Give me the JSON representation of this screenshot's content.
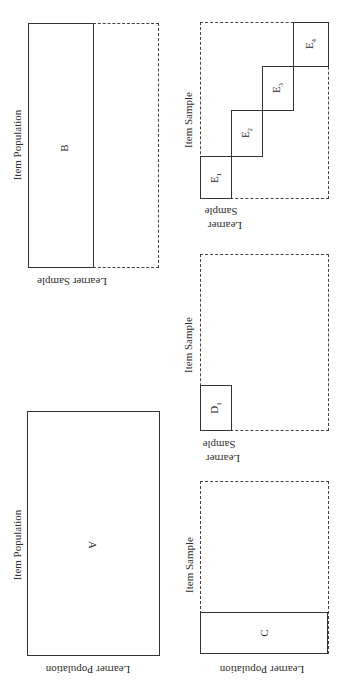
{
  "figure": {
    "orientation": "rotated 90 degrees (landscape figure printed sideways)",
    "panels": [
      {
        "id": "A",
        "letter": "A",
        "axis_item": "Item Population",
        "axis_learner": "Learner Population",
        "description": "Full solid box: entire item population by entire learner population"
      },
      {
        "id": "B",
        "letter": "B",
        "axis_item": "Item Population",
        "axis_learner": "Learner Sample",
        "description": "Solid half-box for learner sample, dashed remainder"
      },
      {
        "id": "C",
        "letter": "C",
        "axis_item": "Item Sample",
        "axis_learner": "Learner Population",
        "description": "Solid strip for item sample across learner population, dashed remainder"
      },
      {
        "id": "D",
        "letter": "D",
        "subscript": "1",
        "axis_item": "Item Sample",
        "axis_learner_line1": "Learner",
        "axis_learner_line2": "Sample",
        "description": "Single small solid block within dashed full matrix"
      },
      {
        "id": "E",
        "axis_item": "Item Sample",
        "axis_learner_line1": "Learner",
        "axis_learner_line2": "Sample",
        "blocks": [
          {
            "letter": "E",
            "subscript": "1"
          },
          {
            "letter": "E",
            "subscript": "2"
          },
          {
            "letter": "E",
            "subscript": "3"
          },
          {
            "letter": "E",
            "subscript": "4"
          }
        ],
        "description": "Four staircase solid blocks within dashed full matrix"
      }
    ]
  }
}
